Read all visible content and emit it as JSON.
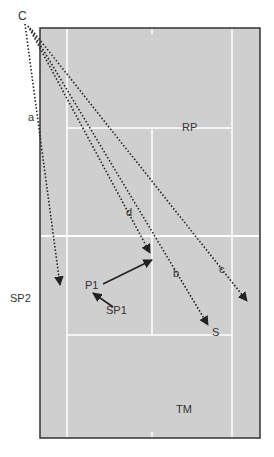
{
  "diagram": {
    "type": "tennis-court-positions",
    "colors": {
      "court": "#cfcfcf",
      "lines": "#ffffff",
      "border": "#333333",
      "arrows": "#222222"
    },
    "labels": {
      "C": "C",
      "a": "a",
      "b": "b",
      "c": "c",
      "d": "d",
      "RP": "RP",
      "SP2": "SP2",
      "P1": "P1",
      "SP1": "SP1",
      "S": "S",
      "TM": "TM"
    }
  }
}
